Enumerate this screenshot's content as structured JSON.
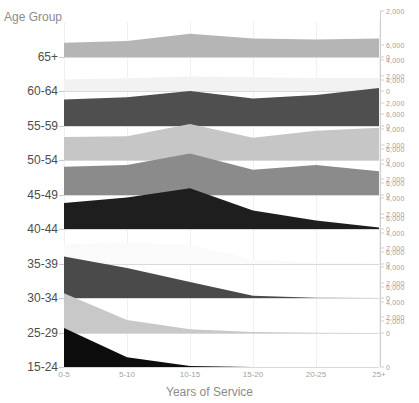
{
  "axes": {
    "y_title": "Age Group",
    "x_title": "Years of Service"
  },
  "clipped_header": "",
  "chart_data": {
    "type": "area",
    "title": "",
    "subtitle": "",
    "xlabel": "Years of Service",
    "ylabel": "Age Group",
    "grid": true,
    "legend": "none",
    "layout": "ridgeline / small-multiples stacked area, one panel per age group, shared x-axis, independent right-hand value axis per panel",
    "categories": [
      "0-5",
      "5-10",
      "10-15",
      "15-20",
      "20-25",
      "25+"
    ],
    "series": [
      {
        "name": "65+",
        "color": "#b5b5b5",
        "ylim": [
          0,
          2000
        ],
        "yticks": [
          0,
          2000
        ],
        "values": [
          620,
          700,
          1010,
          800,
          760,
          800
        ]
      },
      {
        "name": "60-64",
        "color": "#f2f2f2",
        "ylim": [
          0,
          6000
        ],
        "yticks": [
          0,
          2000,
          4000,
          6000
        ],
        "values": [
          1500,
          1650,
          1900,
          1800,
          1700,
          1700
        ]
      },
      {
        "name": "55-59",
        "color": "#4f4f4f",
        "ylim": [
          0,
          4000
        ],
        "yticks": [
          0,
          2000,
          4000
        ],
        "values": [
          2300,
          2500,
          3050,
          2400,
          2700,
          3300
        ]
      },
      {
        "name": "50-54",
        "color": "#c6c6c6",
        "ylim": [
          0,
          6000
        ],
        "yticks": [
          0,
          2000,
          4000,
          6000
        ],
        "values": [
          3000,
          3100,
          4700,
          2900,
          3800,
          4200
        ]
      },
      {
        "name": "45-49",
        "color": "#8b8b8b",
        "ylim": [
          0,
          6000
        ],
        "yticks": [
          0,
          2000,
          4000,
          6000
        ],
        "values": [
          3700,
          3900,
          5400,
          3300,
          3900,
          3100
        ]
      },
      {
        "name": "40-44",
        "color": "#1e1e1e",
        "ylim": [
          0,
          6000
        ],
        "yticks": [
          0,
          2000,
          4000,
          6000
        ],
        "values": [
          3400,
          4100,
          5300,
          2400,
          1100,
          200
        ]
      },
      {
        "name": "35-39",
        "color": "#fafafa",
        "ylim": [
          0,
          6000
        ],
        "yticks": [
          0,
          2000,
          4000,
          6000
        ],
        "values": [
          2600,
          2800,
          2500,
          600,
          150,
          60
        ]
      },
      {
        "name": "30-34",
        "color": "#4a4a4a",
        "ylim": [
          0,
          6000
        ],
        "yticks": [
          0,
          2000,
          4000,
          6000
        ],
        "values": [
          5400,
          3900,
          2100,
          300,
          40,
          0
        ]
      },
      {
        "name": "25-29",
        "color": "#c8c8c8",
        "ylim": [
          0,
          6000
        ],
        "yticks": [
          0,
          2000,
          4000,
          6000
        ],
        "values": [
          5200,
          1700,
          500,
          120,
          30,
          0
        ]
      },
      {
        "name": "15-24",
        "color": "#0d0d0d",
        "ylim": [
          0,
          2000
        ],
        "yticks": [
          0,
          2000
        ],
        "values": [
          1700,
          420,
          40,
          0,
          0,
          0
        ]
      }
    ]
  }
}
